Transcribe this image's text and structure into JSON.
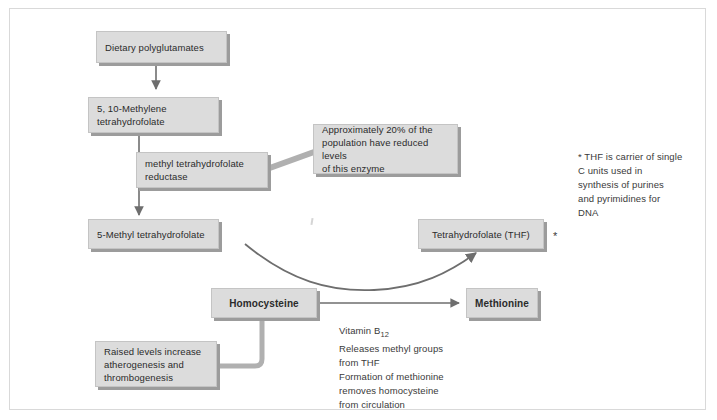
{
  "diagram": {
    "colors": {
      "box_fill": "#dcdcdc",
      "box_border": "#c4c4c4",
      "box_shadow": "#9c9c9c",
      "connector": "#8f8f8f",
      "arrow_dark": "#6e6e6e",
      "text": "#2b2b2b",
      "frame": "#d9d9d9",
      "background": "#ffffff"
    },
    "nodes": {
      "dietary_polyglutamates": "Dietary polyglutamates",
      "methylene_thf": "5, 10-Methylene\ntetrahydrofolate",
      "mthfr_enzyme": "methyl tetrahydrofolate\nreductase",
      "population_note": "Approximately 20% of the\npopulation have reduced levels\nof this enzyme",
      "methyl_thf": "5-Methyl tetrahydrofolate",
      "thf": "Tetrahydrofolate (THF)",
      "homocysteine": "Homocysteine",
      "methionine": "Methionine",
      "raised_levels": "Raised levels increase\natherogenesis and\nthrombogenesis"
    },
    "annotations": {
      "thf_footnote": "* THF is carrier of single\n  C units used in\n  synthesis of purines\n  and pyrimidines for\n  DNA",
      "thf_asterisk": "*",
      "vitamin_b12_line1": "Vitamin B",
      "vitamin_b12_sub": "12",
      "vitamin_b12_rest": "Releases methyl groups\nfrom THF\nFormation of methionine\nremoves homocysteine\nfrom circulation"
    }
  }
}
